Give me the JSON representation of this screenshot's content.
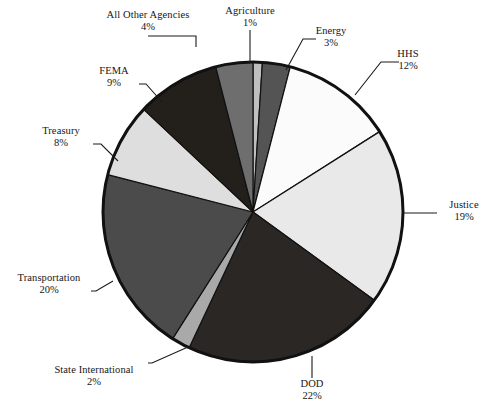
{
  "chart_data": {
    "type": "pie",
    "title": "",
    "subtitle": "",
    "xlabel": "",
    "ylabel": "",
    "units": "percent",
    "legend_position": "none",
    "grid": false,
    "label_format": "name above percent, connected by leader line",
    "start_angle_deg": 0,
    "direction": "clockwise",
    "categories": [
      "Agriculture",
      "Energy",
      "HHS",
      "Justice",
      "DOD",
      "State International",
      "Transportation",
      "Treasury",
      "FEMA",
      "All Other Agencies"
    ],
    "values": [
      1,
      3,
      12,
      19,
      22,
      2,
      20,
      8,
      9,
      4
    ],
    "total": 100,
    "slices": [
      {
        "label": "Agriculture",
        "value": 1,
        "percent_text": "1%",
        "color": "#bfbfbf"
      },
      {
        "label": "Energy",
        "value": 3,
        "percent_text": "3%",
        "color": "#545454"
      },
      {
        "label": "HHS",
        "value": 12,
        "percent_text": "12%",
        "color": "#fbfbfb"
      },
      {
        "label": "Justice",
        "value": 19,
        "percent_text": "19%",
        "color": "#e9e9e9"
      },
      {
        "label": "DOD",
        "value": 22,
        "percent_text": "22%",
        "color": "#2b2724"
      },
      {
        "label": "State International",
        "value": 2,
        "percent_text": "2%",
        "color": "#a9a9a9"
      },
      {
        "label": "Transportation",
        "value": 20,
        "percent_text": "20%",
        "color": "#4b4b4b"
      },
      {
        "label": "Treasury",
        "value": 8,
        "percent_text": "8%",
        "color": "#dedede"
      },
      {
        "label": "FEMA",
        "value": 9,
        "percent_text": "9%",
        "color": "#231f1b"
      },
      {
        "label": "All Other Agencies",
        "value": 4,
        "percent_text": "4%",
        "color": "#6e6e6e"
      }
    ],
    "style": {
      "outline_color": "#111111",
      "outline_width": 3,
      "slice_edge_color": "#111111",
      "background": "#ffffff",
      "center_x": 253,
      "center_y": 212,
      "radius": 150
    }
  },
  "labels": {
    "agriculture": {
      "name": "Agriculture",
      "percent": "1%"
    },
    "energy": {
      "name": "Energy",
      "percent": "3%"
    },
    "hhs": {
      "name": "HHS",
      "percent": "12%"
    },
    "justice": {
      "name": "Justice",
      "percent": "19%"
    },
    "dod": {
      "name": "DOD",
      "percent": "22%"
    },
    "state": {
      "name": "State International",
      "percent": "2%"
    },
    "transportation": {
      "name": "Transportation",
      "percent": "20%"
    },
    "treasury": {
      "name": "Treasury",
      "percent": "8%"
    },
    "fema": {
      "name": "FEMA",
      "percent": "9%"
    },
    "allother": {
      "name": "All Other Agencies",
      "percent": "4%"
    }
  }
}
